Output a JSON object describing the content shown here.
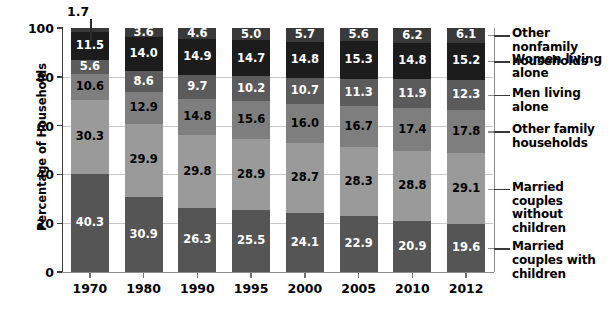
{
  "chart_data": {
    "type": "bar",
    "subtype": "stacked-bar-100",
    "title": "",
    "xlabel": "",
    "ylabel": "Percentage of Households",
    "ylim": [
      0,
      100
    ],
    "yticks": [
      0,
      20,
      40,
      60,
      80,
      100
    ],
    "grid": true,
    "legend_position": "right",
    "categories": [
      "1970",
      "1980",
      "1990",
      "1995",
      "2000",
      "2005",
      "2010",
      "2012"
    ],
    "series": [
      {
        "name": "Married couples with children",
        "color": "#555555",
        "label_color": "#ffffff",
        "values": [
          40.3,
          30.9,
          26.3,
          25.5,
          24.1,
          22.9,
          20.9,
          19.6
        ]
      },
      {
        "name": "Married couples without children",
        "color": "#9a9a9a",
        "label_color": "#000000",
        "values": [
          30.3,
          29.9,
          29.8,
          28.9,
          28.7,
          28.3,
          28.8,
          29.1
        ]
      },
      {
        "name": "Other family households",
        "color": "#7e7e7e",
        "label_color": "#000000",
        "values": [
          10.6,
          12.9,
          14.8,
          15.6,
          16.0,
          16.7,
          17.4,
          17.8
        ]
      },
      {
        "name": "Men living alone",
        "color": "#5b5b5b",
        "label_color": "#ffffff",
        "values": [
          5.6,
          8.6,
          9.7,
          10.2,
          10.7,
          11.3,
          11.9,
          12.3
        ]
      },
      {
        "name": "Women living alone",
        "color": "#1c1c1c",
        "label_color": "#ffffff",
        "values": [
          11.5,
          14.0,
          14.9,
          14.7,
          14.8,
          15.3,
          14.8,
          15.2
        ]
      },
      {
        "name": "Other nonfamily households",
        "color": "#3a3a3a",
        "label_color": "#ffffff",
        "values": [
          1.7,
          3.6,
          4.6,
          5.0,
          5.7,
          5.6,
          6.2,
          6.1
        ]
      }
    ],
    "annotations": [
      {
        "text": "1.7",
        "note": "callout leader for the 1970 top segment, drawn outside the plot"
      }
    ]
  },
  "legend": {
    "entries": [
      "Other nonfamily households",
      "Women living alone",
      "Men living alone",
      "Other family households",
      "Married couples without children",
      "Married couples with children"
    ]
  },
  "axis": {
    "y_title": "Percentage of Households",
    "y_tick_labels": [
      "100",
      "80",
      "60",
      "40",
      "20",
      "0"
    ],
    "x_tick_labels": [
      "1970",
      "1980",
      "1990",
      "1995",
      "2000",
      "2005",
      "2010",
      "2012"
    ]
  },
  "colors": {
    "background": "#ffffff",
    "axis": "#3f3f3f",
    "gridline": "#c9c9c9",
    "text": "#000000"
  }
}
